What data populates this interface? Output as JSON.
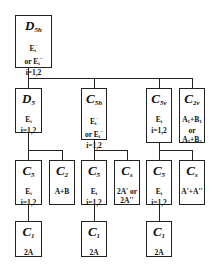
{
  "diagram": {
    "root": {
      "group": "D",
      "sub": "5h",
      "lines": [
        "E_i' ",
        "or E_i''",
        "i=1,2"
      ]
    },
    "level2": [
      {
        "group": "D",
        "sub": "5",
        "lines": [
          "E_i",
          "i=1,2"
        ]
      },
      {
        "group": "C",
        "sub": "5h",
        "lines": [
          "E_i'",
          "or E_i''",
          "i=1,2"
        ]
      },
      {
        "group": "C",
        "sub": "5v",
        "lines": [
          "E_i",
          "i=1,2"
        ]
      },
      {
        "group": "C",
        "sub": "2v",
        "lines": [
          "A_1+B_1",
          "or",
          "A_2+B_2"
        ]
      }
    ],
    "level3": [
      {
        "group": "C",
        "sub": "5",
        "lines": [
          "E_i",
          "i=1,2"
        ],
        "parent": "D5"
      },
      {
        "group": "C",
        "sub": "2",
        "lines": [
          "A+B"
        ],
        "parent": "D5"
      },
      {
        "group": "C",
        "sub": "5",
        "lines": [
          "E_i",
          "i=1,2"
        ],
        "parent": "C5h"
      },
      {
        "group": "C",
        "sub": "s",
        "lines": [
          "2A' or",
          "2A''"
        ],
        "parent": "C5h"
      },
      {
        "group": "C",
        "sub": "5",
        "lines": [
          "E_i",
          "i=1,2"
        ],
        "parent": "C5v"
      },
      {
        "group": "C",
        "sub": "s",
        "lines": [
          "A'+A''"
        ],
        "parent": "C5v"
      }
    ],
    "level4": [
      {
        "group": "C",
        "sub": "1",
        "lines": [
          "2A"
        ]
      },
      {
        "group": "C",
        "sub": "1",
        "lines": [
          "2A"
        ]
      },
      {
        "group": "C",
        "sub": "1",
        "lines": [
          "2A"
        ]
      }
    ]
  },
  "text": {
    "root_g": "D",
    "root_s": "5h",
    "d5_g": "D",
    "d5_s": "5",
    "c5h_g": "C",
    "c5h_s": "5h",
    "c5v_g": "C",
    "c5v_s": "5v",
    "c2v_g": "C",
    "c2v_s": "2v",
    "c5a_g": "C",
    "c5a_s": "5",
    "c2_g": "C",
    "c2_s": "2",
    "c5b_g": "C",
    "c5b_s": "5",
    "csa_g": "C",
    "csa_s": "s",
    "c5c_g": "C",
    "c5c_s": "5",
    "csb_g": "C",
    "csb_s": "s",
    "c1_g": "C",
    "c1_s": "1",
    "E": "E",
    "i": "i",
    "i12": "i=1,2",
    "or": "or",
    "prime": "'",
    "dprime": "''",
    "or_E": "or E",
    "A1B1_a": "A",
    "A1B1_1": "1",
    "A1B1_p": "+B",
    "or2": "or",
    "one": "1",
    "two": "2",
    "AB": "A+B",
    "twoA_or": "2A' or",
    "twoA2": "2A''",
    "ApA": "A'+A''",
    "twoA": "2A"
  }
}
